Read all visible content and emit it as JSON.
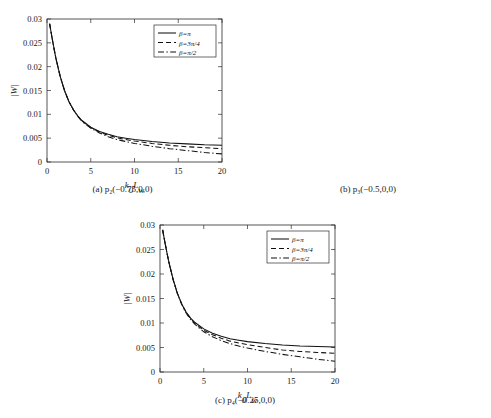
{
  "figure": {
    "panels": [
      {
        "id": "a",
        "caption": "(a) p₂(−0.75,0,0)",
        "chart_ref": 0
      },
      {
        "id": "b",
        "caption": "(b) p₃(−0.5,0,0)",
        "chart_ref": 1
      },
      {
        "id": "c",
        "caption": "(c) p₄(−0.25,0,0)",
        "chart_ref": 2
      }
    ],
    "axis": {
      "xlabel": "k₀L_w",
      "ylabel": "|W|",
      "xticks": [
        "0",
        "5",
        "10",
        "15",
        "20"
      ],
      "yticks": [
        "0",
        "0.005",
        "0.01",
        "0.015",
        "0.02",
        "0.025",
        "0.03"
      ]
    },
    "legend": {
      "entries": [
        "β=π",
        "β=3π/4",
        "β=π/2"
      ],
      "styles": [
        "solid",
        "dashed",
        "dashdot"
      ],
      "position": "upper-right"
    },
    "colors": {
      "curve": "#111111",
      "frame": "#2b2b2b",
      "background": "#ffffff"
    }
  },
  "chart_data": [
    {
      "type": "line",
      "title": "(a) p₂(−0.75,0,0)",
      "xlabel": "k₀L_w",
      "ylabel": "|W|",
      "xlim": [
        0,
        20
      ],
      "ylim": [
        0,
        0.03
      ],
      "grid": false,
      "legend_position": "upper right",
      "x": [
        0.3,
        0.6,
        1,
        1.5,
        2,
        2.5,
        3,
        3.5,
        4,
        5,
        6,
        7,
        8,
        9,
        10,
        12,
        14,
        16,
        18,
        20
      ],
      "series": [
        {
          "name": "β=π",
          "style": "solid",
          "values": [
            0.029,
            0.0258,
            0.0219,
            0.018,
            0.015,
            0.0127,
            0.011,
            0.0097,
            0.0087,
            0.0073,
            0.0064,
            0.0058,
            0.0053,
            0.005,
            0.0047,
            0.0043,
            0.004,
            0.0038,
            0.0036,
            0.0035
          ]
        },
        {
          "name": "β=3π/4",
          "style": "dashed",
          "values": [
            0.029,
            0.0258,
            0.0219,
            0.018,
            0.015,
            0.0127,
            0.011,
            0.0097,
            0.0086,
            0.0072,
            0.0063,
            0.0056,
            0.0051,
            0.0047,
            0.0044,
            0.0039,
            0.0035,
            0.0032,
            0.003,
            0.0028
          ]
        },
        {
          "name": "β=π/2",
          "style": "dashdot",
          "values": [
            0.029,
            0.0258,
            0.0219,
            0.018,
            0.015,
            0.0127,
            0.011,
            0.0096,
            0.0085,
            0.0071,
            0.0061,
            0.0053,
            0.0047,
            0.0043,
            0.0039,
            0.0033,
            0.0028,
            0.0024,
            0.002,
            0.0017
          ]
        }
      ]
    },
    {
      "type": "line",
      "title": "(b) p₃(−0.5,0,0)",
      "xlabel": "k₀L_w",
      "ylabel": "|W|",
      "xlim": [
        0,
        20
      ],
      "ylim": [
        0,
        0.03
      ],
      "grid": false,
      "legend_position": "upper right",
      "x": [
        0.3,
        0.6,
        1,
        1.5,
        2,
        2.5,
        3,
        3.5,
        4,
        5,
        6,
        7,
        8,
        9,
        10,
        12,
        14,
        16,
        18,
        20
      ],
      "series": [
        {
          "name": "β=π",
          "style": "solid",
          "values": [
            0.029,
            0.0259,
            0.0221,
            0.0183,
            0.0153,
            0.013,
            0.0113,
            0.01,
            0.009,
            0.0076,
            0.0067,
            0.0061,
            0.0057,
            0.0053,
            0.0051,
            0.0047,
            0.0044,
            0.0042,
            0.004,
            0.0039
          ]
        },
        {
          "name": "β=3π/4",
          "style": "dashed",
          "values": [
            0.029,
            0.0259,
            0.0221,
            0.0183,
            0.0153,
            0.013,
            0.0113,
            0.01,
            0.0089,
            0.0075,
            0.0065,
            0.0058,
            0.0053,
            0.0049,
            0.0046,
            0.004,
            0.0036,
            0.0033,
            0.003,
            0.0028
          ]
        },
        {
          "name": "β=π/2",
          "style": "dashdot",
          "values": [
            0.029,
            0.0259,
            0.0221,
            0.0183,
            0.0153,
            0.013,
            0.0112,
            0.0099,
            0.0088,
            0.0073,
            0.0063,
            0.0055,
            0.0049,
            0.0044,
            0.004,
            0.0034,
            0.0029,
            0.0024,
            0.002,
            0.0016
          ]
        }
      ]
    },
    {
      "type": "line",
      "title": "(c) p₄(−0.25,0,0)",
      "xlabel": "k₀L_w",
      "ylabel": "|W|",
      "xlim": [
        0,
        20
      ],
      "ylim": [
        0,
        0.03
      ],
      "grid": false,
      "legend_position": "upper right",
      "x": [
        0.3,
        0.6,
        1,
        1.5,
        2,
        2.5,
        3,
        3.5,
        4,
        5,
        6,
        7,
        8,
        9,
        10,
        12,
        14,
        16,
        18,
        20
      ],
      "series": [
        {
          "name": "β=π",
          "style": "solid",
          "values": [
            0.029,
            0.0261,
            0.0225,
            0.0189,
            0.016,
            0.0138,
            0.0122,
            0.011,
            0.0101,
            0.0088,
            0.0079,
            0.0073,
            0.0068,
            0.0065,
            0.0062,
            0.0058,
            0.0055,
            0.0053,
            0.0052,
            0.0051
          ]
        },
        {
          "name": "β=3π/4",
          "style": "dashed",
          "values": [
            0.029,
            0.0261,
            0.0225,
            0.0189,
            0.016,
            0.0138,
            0.0121,
            0.0109,
            0.0099,
            0.0085,
            0.0076,
            0.0069,
            0.0063,
            0.0059,
            0.0056,
            0.005,
            0.0045,
            0.0042,
            0.004,
            0.0038
          ]
        },
        {
          "name": "β=π/2",
          "style": "dashdot",
          "values": [
            0.029,
            0.0261,
            0.0225,
            0.0188,
            0.0159,
            0.0137,
            0.012,
            0.0107,
            0.0097,
            0.0082,
            0.0072,
            0.0064,
            0.0058,
            0.0053,
            0.0049,
            0.0042,
            0.0036,
            0.0031,
            0.0026,
            0.0022
          ]
        }
      ]
    }
  ]
}
